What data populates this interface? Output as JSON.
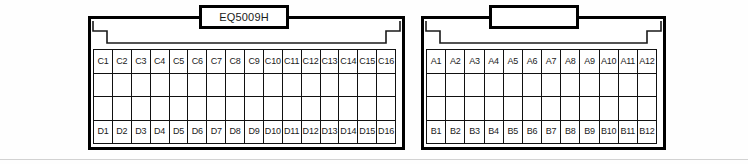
{
  "figure": {
    "type": "connector-pinout-diagram",
    "connector_count": 2
  },
  "connectors": [
    {
      "id": "left-connector",
      "label": "EQ5009H",
      "label_visible": true,
      "columns": 16,
      "rows": 4,
      "row_labels": [
        "C",
        "",
        "",
        "D"
      ],
      "grid": [
        [
          "C1",
          "C2",
          "C3",
          "C4",
          "C5",
          "C6",
          "C7",
          "C8",
          "C9",
          "C10",
          "C11",
          "C12",
          "C13",
          "C14",
          "C15",
          "C16"
        ],
        [
          "",
          "",
          "",
          "",
          "",
          "",
          "",
          "",
          "",
          "",
          "",
          "",
          "",
          "",
          "",
          ""
        ],
        [
          "",
          "",
          "",
          "",
          "",
          "",
          "",
          "",
          "",
          "",
          "",
          "",
          "",
          "",
          "",
          ""
        ],
        [
          "D1",
          "D2",
          "D3",
          "D4",
          "D5",
          "D6",
          "D7",
          "D8",
          "D9",
          "D10",
          "D11",
          "D12",
          "D13",
          "D14",
          "D15",
          "D16"
        ]
      ]
    },
    {
      "id": "right-connector",
      "label": "",
      "label_visible": true,
      "columns": 12,
      "rows": 4,
      "row_labels": [
        "A",
        "",
        "",
        "B"
      ],
      "grid": [
        [
          "A1",
          "A2",
          "A3",
          "A4",
          "A5",
          "A6",
          "A7",
          "A8",
          "A9",
          "A10",
          "A11",
          "A12"
        ],
        [
          "",
          "",
          "",
          "",
          "",
          "",
          "",
          "",
          "",
          "",
          "",
          ""
        ],
        [
          "",
          "",
          "",
          "",
          "",
          "",
          "",
          "",
          "",
          "",
          "",
          ""
        ],
        [
          "B1",
          "B2",
          "B3",
          "B4",
          "B5",
          "B6",
          "B7",
          "B8",
          "B9",
          "B10",
          "B11",
          "B12"
        ]
      ]
    }
  ],
  "colors": {
    "line": "#000000",
    "grid_line": "#111111",
    "background": "#ffffff",
    "baseline_rule": "#d2d2d2",
    "text": "#1a1a1a"
  }
}
